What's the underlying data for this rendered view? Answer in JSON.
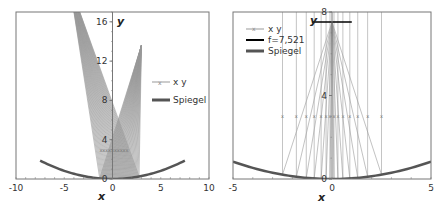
{
  "chart_data": [
    {
      "type": "line",
      "title": "",
      "xlabel": "x",
      "ylabel": "y",
      "xlim": [
        -10,
        10
      ],
      "ylim": [
        0,
        17
      ],
      "xticks": [
        "-10",
        "-5",
        "0",
        "5",
        "10"
      ],
      "yticks": [
        "0",
        "4",
        "8",
        "12",
        "16"
      ],
      "grid": false,
      "legend_position": "right",
      "legend": [
        "x y",
        "Spiegel"
      ],
      "series": [
        {
          "name": "Spiegel",
          "kind": "parabola",
          "x_range": [
            -7.5,
            7.5
          ],
          "equation": "y = x^2/30",
          "color": "#555555"
        },
        {
          "name": "x y",
          "kind": "reflected rays",
          "source_point": [
            3.0,
            13.6
          ],
          "reflect_to": [
            -3.8,
            17
          ],
          "marker_y": 3.0,
          "color": "#999999"
        }
      ]
    },
    {
      "type": "line",
      "title": "",
      "xlabel": "x",
      "ylabel": "y",
      "xlim": [
        -5,
        5
      ],
      "ylim": [
        0,
        8
      ],
      "xticks": [
        "-5",
        "0",
        "5"
      ],
      "yticks": [
        "0",
        "4",
        "8"
      ],
      "grid": false,
      "legend_position": "upper-left",
      "legend": [
        "x y",
        "f=7,521",
        "Spiegel"
      ],
      "focal_length": 7.521,
      "series": [
        {
          "name": "Spiegel",
          "kind": "parabola",
          "x_range": [
            -5,
            5
          ],
          "equation": "y = x^2/30",
          "color": "#555555"
        },
        {
          "name": "f=7,521",
          "kind": "horizontal line",
          "y": 7.521,
          "x_range": [
            -1,
            1
          ],
          "color": "#000000"
        },
        {
          "name": "x y",
          "kind": "parallel rays to focus",
          "x_positions": [
            -2.5,
            -1.8,
            -1.3,
            -0.9,
            -0.55,
            -0.3,
            -0.1,
            0.1,
            0.3,
            0.55,
            0.9,
            1.3,
            1.8,
            2.5
          ],
          "focus": [
            0,
            7.521
          ],
          "marker_y": 3.0,
          "color": "#999999"
        }
      ]
    }
  ],
  "left": {
    "legend": {
      "item1": "x y",
      "item2": "Spiegel"
    },
    "xlabel": "x",
    "ylabel": "y"
  },
  "right": {
    "legend": {
      "item1": "x y",
      "item2": "f=7,521",
      "item3": "Spiegel"
    },
    "xlabel": "x",
    "ylabel": "y"
  }
}
